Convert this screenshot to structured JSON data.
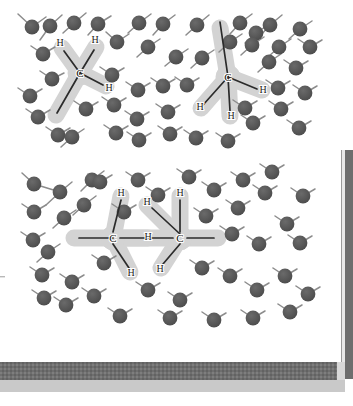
{
  "figure": {
    "background_color": "#ffffff",
    "panel_count": 2,
    "water_atom_color": "#565656",
    "water_bond_color": "#8c8c8c",
    "solute_halo_color": "#d3d3d3",
    "solute_bond_color": "#2b2b2b",
    "label_color": "#1a1a1a",
    "footer_band_color": "#6e6e6e",
    "footer_band_shadow_color": "#c9c9c9",
    "right_bar_color": "#6e6e6e",
    "right_bar_edge_color": "#e2e2e2"
  },
  "panels": [
    {
      "name": "top-panel",
      "description": "Two methane molecules in a water cage",
      "solutes": [
        {
          "name": "methane-left",
          "carbon_label": "C",
          "hydrogen_labels": [
            "H",
            "H",
            "H"
          ],
          "hydrogen_count": 4
        },
        {
          "name": "methane-right",
          "carbon_label": "C",
          "hydrogen_labels": [
            "H",
            "H",
            "H"
          ],
          "hydrogen_count": 4
        }
      ]
    },
    {
      "name": "bottom-panel",
      "description": "An ethane molecule in a water cage",
      "solutes": [
        {
          "name": "ethane",
          "carbon_labels": [
            "C",
            "C"
          ],
          "hydrogen_labels": [
            "H",
            "H",
            "H",
            "H"
          ],
          "carbon_count": 2
        }
      ]
    }
  ],
  "labels": {
    "carbon": "C",
    "hydrogen": "H"
  },
  "top_panel_labels": {
    "left_molecule": {
      "c": "C",
      "h_upper_left": "H",
      "h_upper_right": "H",
      "h_right": "H"
    },
    "right_molecule": {
      "c": "C",
      "h_right": "H",
      "h_lower_left": "H",
      "h_bottom": "H"
    }
  },
  "bottom_panel_labels": {
    "left_carbon": {
      "c": "C",
      "h_top": "H",
      "h_right": "H",
      "h_bottom": "H"
    },
    "right_carbon": {
      "c": "C",
      "h_top": "H",
      "h_left": "H",
      "h_bottom": "H"
    }
  },
  "water_molecules": {
    "top_panel_count": 44,
    "bottom_panel_count": 45,
    "shape": "circle-with-two-bonds"
  }
}
